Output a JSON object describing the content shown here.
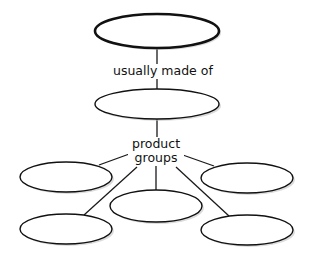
{
  "diagram": {
    "type": "concept-map",
    "colors": {
      "stroke": "#111111",
      "fill": "#ffffff",
      "shadow": "#bdbdbd"
    },
    "nodes": [
      {
        "id": "root",
        "label": "",
        "cx": 157,
        "cy": 31,
        "rx": 62,
        "ry": 17
      },
      {
        "id": "mid",
        "label": "",
        "cx": 157,
        "cy": 104,
        "rx": 62,
        "ry": 15
      },
      {
        "id": "group-left-top",
        "label": "",
        "cx": 66,
        "cy": 177,
        "rx": 46,
        "ry": 15
      },
      {
        "id": "group-right-top",
        "label": "",
        "cx": 247,
        "cy": 178,
        "rx": 46,
        "ry": 15
      },
      {
        "id": "group-center",
        "label": "",
        "cx": 156,
        "cy": 206,
        "rx": 46,
        "ry": 16
      },
      {
        "id": "group-left-bottom",
        "label": "",
        "cx": 66,
        "cy": 229,
        "rx": 46,
        "ry": 15
      },
      {
        "id": "group-right-bottom",
        "label": "",
        "cx": 247,
        "cy": 230,
        "rx": 46,
        "ry": 15
      }
    ],
    "link_labels": {
      "made_of": "usually made of",
      "groups_line1": "product",
      "groups_line2": "groups"
    }
  }
}
